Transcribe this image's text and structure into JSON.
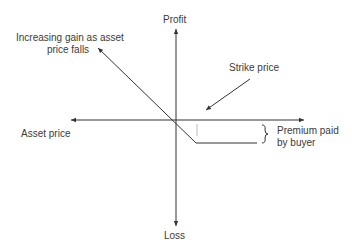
{
  "diagram": {
    "type": "put-option-payoff",
    "axes": {
      "y_top_label": "Profit",
      "y_bottom_label": "Loss",
      "x_label": "Asset price"
    },
    "annotations": {
      "gain": "Increasing gain as asset price falls",
      "gain_line1": "Increasing gain as asset",
      "gain_line2": "price falls",
      "strike": "Strike price",
      "premium_line1": "Premium paid",
      "premium_line2": "by buyer"
    },
    "colors": {
      "line": "#333333",
      "guide": "#bbbbbb"
    }
  }
}
